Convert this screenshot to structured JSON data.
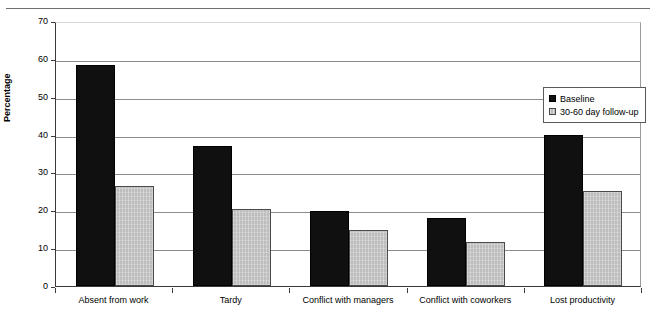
{
  "chart_data": {
    "type": "bar",
    "title": "",
    "xlabel": "",
    "ylabel": "Percentage",
    "ylim": [
      0,
      70
    ],
    "ytick_step": 10,
    "yticks": [
      "0",
      "10",
      "20",
      "30",
      "40",
      "50",
      "60",
      "70"
    ],
    "grid": true,
    "legend_position": "top-right-inside",
    "categories": [
      "Absent from work",
      "Tardy",
      "Conflict with managers",
      "Conflict with coworkers",
      "Lost productivity"
    ],
    "series": [
      {
        "name": "Baseline",
        "color": "#101010",
        "values": [
          58.5,
          37.0,
          19.7,
          18.0,
          39.8
        ]
      },
      {
        "name": "30-60 day follow-up",
        "color": "#bdbdbd",
        "values": [
          26.5,
          20.3,
          14.8,
          11.7,
          25.0
        ]
      }
    ]
  },
  "legend": {
    "entries": [
      {
        "label": "Baseline"
      },
      {
        "label": "30-60 day follow-up"
      }
    ]
  },
  "header": {
    "clipped_text": ""
  }
}
